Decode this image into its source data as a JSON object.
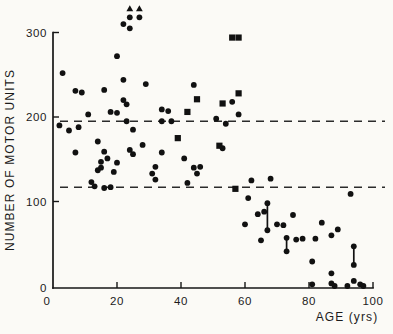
{
  "figure": {
    "background_color": "#fbfaf6",
    "ink_color": "#111111"
  },
  "chart_data": {
    "type": "scatter",
    "title": "",
    "xlabel": "AGE (yrs)",
    "ylabel": "NUMBER OF MOTOR UNITS",
    "xlim": [
      0,
      100
    ],
    "ylim": [
      0,
      300
    ],
    "x_ticks": [
      0,
      20,
      40,
      60,
      80,
      100
    ],
    "y_ticks": [
      0,
      100,
      200,
      300
    ],
    "grid": false,
    "legend": "none",
    "reference_lines": [
      {
        "y": 195,
        "style": "dashed"
      },
      {
        "y": 117,
        "style": "dashed"
      }
    ],
    "series": [
      {
        "name": "motor-unit-counts-circles",
        "marker": "circle",
        "points": [
          [
            3,
            252
          ],
          [
            2,
            190
          ],
          [
            5,
            184
          ],
          [
            7,
            231
          ],
          [
            9,
            229
          ],
          [
            8,
            188
          ],
          [
            11,
            203
          ],
          [
            7,
            158
          ],
          [
            12,
            123
          ],
          [
            13,
            118
          ],
          [
            14,
            171
          ],
          [
            14,
            137
          ],
          [
            15,
            147
          ],
          [
            15,
            140
          ],
          [
            16,
            116
          ],
          [
            16,
            159
          ],
          [
            17,
            151
          ],
          [
            18,
            117
          ],
          [
            16,
            232
          ],
          [
            18,
            206
          ],
          [
            20,
            205
          ],
          [
            19,
            135
          ],
          [
            20,
            146
          ],
          [
            20,
            272
          ],
          [
            22,
            244
          ],
          [
            22,
            220
          ],
          [
            23,
            215
          ],
          [
            23,
            195
          ],
          [
            22,
            310
          ],
          [
            24,
            305
          ],
          [
            25,
            185
          ],
          [
            24,
            161
          ],
          [
            25,
            156
          ],
          [
            28,
            167
          ],
          [
            29,
            239
          ],
          [
            31,
            133
          ],
          [
            32,
            126
          ],
          [
            32,
            141
          ],
          [
            34,
            209
          ],
          [
            34,
            158
          ],
          [
            34,
            195
          ],
          [
            37,
            195
          ],
          [
            36,
            207
          ],
          [
            41,
            151
          ],
          [
            44,
            238
          ],
          [
            44,
            140
          ],
          [
            46,
            141
          ],
          [
            45,
            133
          ],
          [
            42,
            122
          ],
          [
            51,
            198
          ],
          [
            53,
            163
          ],
          [
            56,
            218
          ],
          [
            54,
            192
          ],
          [
            58,
            203
          ],
          [
            61,
            104
          ],
          [
            62,
            125
          ],
          [
            68,
            127
          ],
          [
            64,
            85
          ],
          [
            66,
            88
          ],
          [
            60,
            73
          ],
          [
            70,
            73
          ],
          [
            75,
            84
          ],
          [
            72,
            72
          ],
          [
            65,
            54
          ],
          [
            76,
            55
          ],
          [
            78,
            56
          ],
          [
            82,
            56
          ],
          [
            81,
            29
          ],
          [
            84,
            75
          ],
          [
            87,
            60
          ],
          [
            89,
            67
          ],
          [
            93,
            109
          ],
          [
            87,
            15
          ],
          [
            81,
            2
          ],
          [
            87,
            3
          ],
          [
            88,
            0
          ],
          [
            92,
            0
          ],
          [
            94,
            6
          ],
          [
            96,
            2
          ],
          [
            97,
            0
          ]
        ]
      },
      {
        "name": "motor-unit-counts-squares",
        "marker": "square",
        "points": [
          [
            42,
            206
          ],
          [
            39,
            175
          ],
          [
            45,
            221
          ],
          [
            52,
            166
          ],
          [
            53,
            216
          ],
          [
            56,
            294
          ],
          [
            58,
            294
          ],
          [
            58,
            228
          ],
          [
            57,
            115
          ]
        ]
      },
      {
        "name": "off-scale-values",
        "marker": "circle-with-up-arrow",
        "note": "values above top of scale, marked with upward arrows",
        "points": [
          [
            24,
            318
          ],
          [
            27,
            318
          ]
        ]
      },
      {
        "name": "linked-repeat-measurements",
        "marker": "circle-pair-joined-by-vertical-line",
        "pairs": [
          [
            [
              67,
              98
            ],
            [
              67,
              66
            ]
          ],
          [
            [
              73,
              57
            ],
            [
              73,
              41
            ]
          ],
          [
            [
              94,
              47
            ],
            [
              94,
              25
            ]
          ]
        ]
      }
    ]
  }
}
